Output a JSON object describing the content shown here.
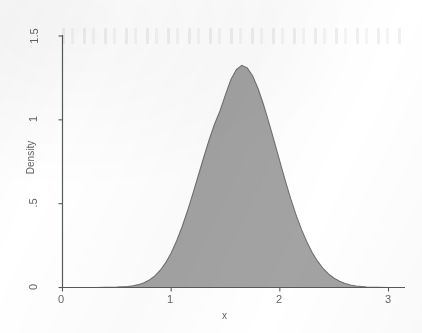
{
  "chart_data": {
    "type": "area",
    "title": "",
    "subtitle": "",
    "xlabel": "x",
    "ylabel": "Density",
    "xlim": [
      0,
      3.05
    ],
    "ylim": [
      0,
      1.5
    ],
    "grid": false,
    "legend": null,
    "x_ticks": [
      "0",
      "1",
      "2",
      "3"
    ],
    "x_tick_values": [
      0,
      1,
      2,
      3
    ],
    "y_ticks": [
      "0",
      ".5",
      "1",
      "1.5"
    ],
    "y_tick_values": [
      0,
      0.5,
      1,
      1.5
    ],
    "fill_color": "#c9c9c9",
    "line_color": "#6e7174",
    "axis_color": "#555a5d",
    "series": [
      {
        "name": "Density",
        "x": [
          0.0,
          0.1,
          0.2,
          0.3,
          0.4,
          0.5,
          0.6,
          0.65,
          0.7,
          0.75,
          0.8,
          0.85,
          0.9,
          0.95,
          1.0,
          1.05,
          1.1,
          1.15,
          1.2,
          1.25,
          1.3,
          1.35,
          1.4,
          1.45,
          1.5,
          1.55,
          1.6,
          1.65,
          1.7,
          1.75,
          1.8,
          1.85,
          1.9,
          1.95,
          2.0,
          2.05,
          2.1,
          2.15,
          2.2,
          2.25,
          2.3,
          2.35,
          2.4,
          2.45,
          2.5,
          2.55,
          2.6,
          2.65,
          2.7,
          2.8,
          2.9,
          3.0
        ],
        "y": [
          0.0,
          0.0,
          0.0,
          0.0,
          0.001,
          0.002,
          0.006,
          0.01,
          0.017,
          0.028,
          0.045,
          0.069,
          0.103,
          0.148,
          0.206,
          0.277,
          0.361,
          0.456,
          0.56,
          0.668,
          0.777,
          0.881,
          0.975,
          1.055,
          1.15,
          1.24,
          1.3,
          1.325,
          1.31,
          1.262,
          1.185,
          1.09,
          0.982,
          0.868,
          0.752,
          0.638,
          0.53,
          0.432,
          0.345,
          0.27,
          0.206,
          0.154,
          0.112,
          0.08,
          0.055,
          0.037,
          0.024,
          0.015,
          0.009,
          0.003,
          0.001,
          0.0
        ]
      }
    ],
    "peak": {
      "x": 1.65,
      "y": 1.325
    },
    "annotations": []
  },
  "axes": {
    "x_title": "x",
    "y_title": "Density",
    "x_tick_labels": [
      "0",
      "1",
      "2",
      "3"
    ],
    "y_tick_labels": [
      "1.5",
      "1",
      ".5",
      "0"
    ]
  }
}
